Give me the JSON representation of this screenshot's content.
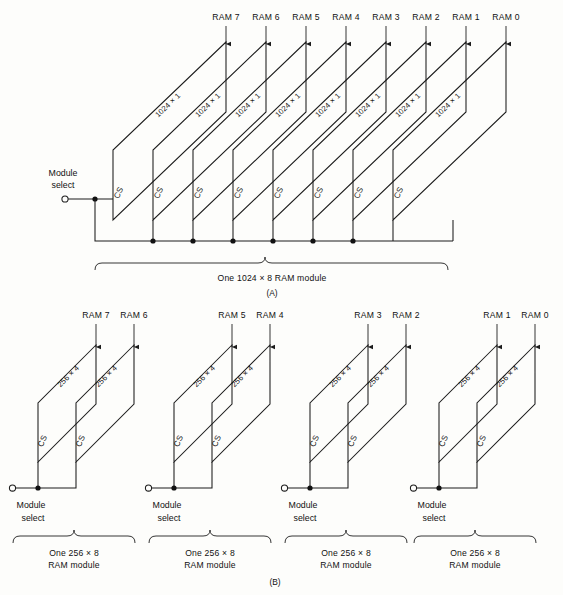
{
  "figure": {
    "background_color": "#fdfdfb",
    "ink_color": "#1c1c1c"
  },
  "part_a": {
    "part_label": "(A)",
    "caption": "One 1024 × 8 RAM module",
    "module_select_label_line1": "Module",
    "module_select_label_line2": "select",
    "chip_size_label": "1024 × 1",
    "chip_select_label": "CS",
    "ram_labels": [
      "RAM 7",
      "RAM 6",
      "RAM 5",
      "RAM 4",
      "RAM 3",
      "RAM 2",
      "RAM 1",
      "RAM 0"
    ],
    "chip_count": 8
  },
  "part_b": {
    "part_label": "(B)",
    "chip_size_label": "256 × 4",
    "chip_select_label": "CS",
    "module_select_label_line1": "Module",
    "module_select_label_line2": "select",
    "caption_line1": "One 256 × 8",
    "caption_line2": "RAM module",
    "groups": [
      {
        "ram_labels": [
          "RAM 7",
          "RAM 6"
        ]
      },
      {
        "ram_labels": [
          "RAM 5",
          "RAM 4"
        ]
      },
      {
        "ram_labels": [
          "RAM 3",
          "RAM 2"
        ]
      },
      {
        "ram_labels": [
          "RAM 1",
          "RAM 0"
        ]
      }
    ],
    "group_count": 4,
    "chips_per_group": 2
  }
}
